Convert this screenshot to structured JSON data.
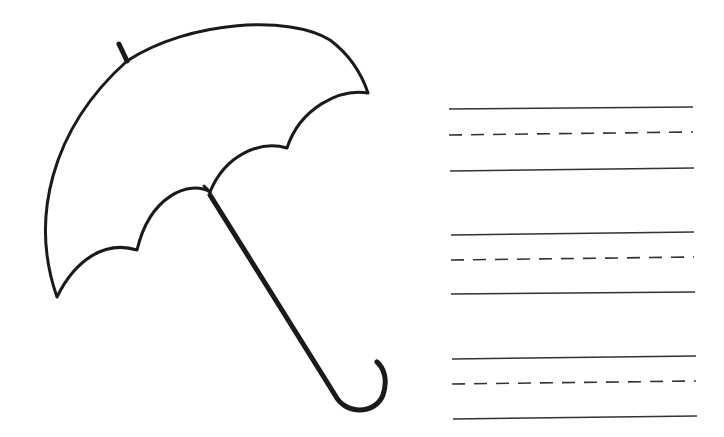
{
  "worksheet": {
    "title": "Umbrella handwriting practice worksheet",
    "illustration": {
      "subject": "umbrella",
      "icon": "umbrella-icon",
      "stroke_color": "#1a1a1a"
    },
    "writing_lines": {
      "groups": 3,
      "line_color": "#333333",
      "pattern": [
        "solid",
        "dashed",
        "solid"
      ],
      "rows": [
        {
          "top": 108,
          "mid": 133,
          "bottom": 168
        },
        {
          "top": 233,
          "mid": 258,
          "bottom": 292
        },
        {
          "top": 357,
          "mid": 382,
          "bottom": 417
        }
      ]
    }
  }
}
